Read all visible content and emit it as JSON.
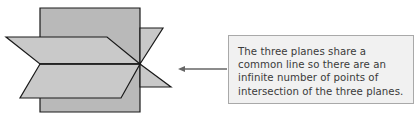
{
  "diagram": {
    "colors": {
      "vertical_plane": "#b9b9b9",
      "horizontal_planes": "#c9c9c9",
      "edge": "#1a1a1a",
      "arrow": "#666666",
      "callout_bg": "#f1f1f1",
      "callout_border": "#a9a9a9",
      "callout_text": "#3a3a3a"
    }
  },
  "callout": {
    "lines": [
      "The three planes share a",
      "common line so there are an",
      "infinite number of points of",
      "intersection of the three planes."
    ]
  }
}
